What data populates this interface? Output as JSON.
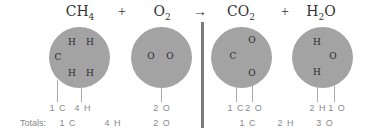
{
  "equation": {
    "reactants": [
      {
        "formula_base": "CH",
        "formula_sub": "4",
        "atoms": [
          "C",
          "H",
          "H",
          "H",
          "H"
        ],
        "counts": [
          "1 C",
          "4 H"
        ]
      },
      {
        "formula_base": "O",
        "formula_sub": "2",
        "atoms": [
          "O",
          "O"
        ],
        "counts": [
          "2 O"
        ]
      }
    ],
    "products": [
      {
        "formula_base": "CO",
        "formula_sub": "2",
        "atoms": [
          "C",
          "O",
          "O"
        ],
        "counts": [
          "1 C",
          "2 O"
        ]
      },
      {
        "formula_pre": "H",
        "formula_sub": "2",
        "formula_post": "O",
        "atoms": [
          "H",
          "O",
          "H"
        ],
        "counts": [
          "2 H",
          "1 O"
        ]
      }
    ],
    "plus": "+",
    "arrow": "→"
  },
  "totals": {
    "label": "Totals:",
    "reactants": [
      "1 C",
      "4 H",
      "2 O"
    ],
    "products": [
      "1 C",
      "2 H",
      "3 O"
    ]
  },
  "colors": {
    "molecule": "#a3a3a3",
    "divider": "#7c7c7c",
    "count_text": "#888888"
  }
}
